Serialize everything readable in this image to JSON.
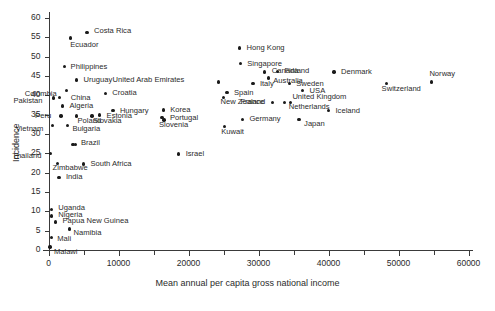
{
  "chart_data": {
    "type": "scatter",
    "title": "",
    "xlabel": "Mean annual per capita gross national income",
    "ylabel": "Incidence",
    "xlim": [
      0,
      60000
    ],
    "ylim": [
      0,
      62
    ],
    "xticks": [
      0,
      10000,
      20000,
      30000,
      40000,
      50000,
      60000
    ],
    "xtick_labels": [
      "0",
      "10000",
      "20000",
      "30000",
      "40000",
      "50000",
      "60000"
    ],
    "xminor_ticks": [
      5000,
      15000,
      25000,
      35000,
      45000,
      55000
    ],
    "yticks": [
      0,
      5,
      10,
      15,
      20,
      25,
      30,
      35,
      40,
      45,
      50,
      55,
      60
    ],
    "ytick_labels": [
      "0",
      "5",
      "10",
      "15",
      "20",
      "25",
      "30",
      "35",
      "40",
      "45",
      "50",
      "55",
      "60"
    ],
    "grid": false,
    "legend": "none",
    "marker": "filled-circle",
    "marker_color": "#1a1a1a",
    "points": [
      {
        "label": "Costa Rica",
        "x": 5500,
        "y": 56.3,
        "lx": 7,
        "ly": -1
      },
      {
        "label": "Ecuador",
        "x": 3100,
        "y": 54.8,
        "lx": 0,
        "ly": 7
      },
      {
        "label": "Philippines",
        "x": 2300,
        "y": 47.4,
        "lx": 6,
        "ly": 0
      },
      {
        "label": "Uruguay",
        "x": 4000,
        "y": 44.0,
        "lx": 7,
        "ly": 0
      },
      {
        "label": "Colombia",
        "x": 2600,
        "y": 41.2,
        "lx": -42,
        "ly": 3
      },
      {
        "label": "Croatia",
        "x": 8100,
        "y": 40.5,
        "lx": 7,
        "ly": 0
      },
      {
        "label": "China",
        "x": 1600,
        "y": 39.5,
        "lx": 11,
        "ly": 1
      },
      {
        "label": "Pakistan",
        "x": 700,
        "y": 39.3,
        "lx": -40,
        "ly": 3
      },
      {
        "label": "Algeria",
        "x": 2000,
        "y": 37.2,
        "lx": 7,
        "ly": 0
      },
      {
        "label": "Hungary",
        "x": 9200,
        "y": 36.0,
        "lx": 7,
        "ly": 0
      },
      {
        "label": "Peru",
        "x": 1800,
        "y": 34.7,
        "lx": -26,
        "ly": 0
      },
      {
        "label": "Poland",
        "x": 4000,
        "y": 34.7,
        "lx": 1,
        "ly": 5
      },
      {
        "label": "Slovakia",
        "x": 6200,
        "y": 34.7,
        "lx": 1,
        "ly": 5
      },
      {
        "label": "Estonia",
        "x": 7300,
        "y": 34.9,
        "lx": 7,
        "ly": 1
      },
      {
        "label": "Vietnam",
        "x": 600,
        "y": 32.2,
        "lx": -37,
        "ly": 4
      },
      {
        "label": "Bulgaria",
        "x": 2700,
        "y": 32.2,
        "lx": 5,
        "ly": 4
      },
      {
        "label": "Brazil",
        "x": 3500,
        "y": 27.3,
        "lx": 8,
        "ly": -1
      },
      {
        "label": "",
        "x": 3900,
        "y": 27.3,
        "lx": 0,
        "ly": 0
      },
      {
        "label": "Thailand",
        "x": 250,
        "y": 25.0,
        "lx": -38,
        "ly": 3
      },
      {
        "label": "Israel",
        "x": 18600,
        "y": 24.8,
        "lx": 7,
        "ly": 0
      },
      {
        "label": "Zimbabwe",
        "x": 1300,
        "y": 22.4,
        "lx": -5,
        "ly": 5
      },
      {
        "label": "South Africa",
        "x": 5000,
        "y": 22.2,
        "lx": 7,
        "ly": 0
      },
      {
        "label": "India",
        "x": 1500,
        "y": 18.8,
        "lx": 7,
        "ly": 0
      },
      {
        "label": "Uganda",
        "x": 400,
        "y": 10.5,
        "lx": 7,
        "ly": -1
      },
      {
        "label": "Nigeria",
        "x": 400,
        "y": 8.8,
        "lx": 7,
        "ly": -1
      },
      {
        "label": "Papua New Guinea",
        "x": 1000,
        "y": 7.2,
        "lx": 7,
        "ly": -1
      },
      {
        "label": "Namibia",
        "x": 3000,
        "y": 5.4,
        "lx": 4,
        "ly": 4
      },
      {
        "label": "Mali",
        "x": 400,
        "y": 3.2,
        "lx": 6,
        "ly": 1
      },
      {
        "label": "Malawi",
        "x": 200,
        "y": 0.8,
        "lx": 4,
        "ly": 5
      },
      {
        "label": "United Arab Emirates",
        "x": 24300,
        "y": 43.4,
        "lx": -106,
        "ly": -2
      },
      {
        "label": "Hong Kong",
        "x": 27300,
        "y": 52.2,
        "lx": 7,
        "ly": 0
      },
      {
        "label": "Singapore",
        "x": 27400,
        "y": 48.2,
        "lx": 7,
        "ly": 0
      },
      {
        "label": "Canada",
        "x": 30900,
        "y": 46.0,
        "lx": 7,
        "ly": -1
      },
      {
        "label": "Finland",
        "x": 32700,
        "y": 46.2,
        "lx": 7,
        "ly": 0
      },
      {
        "label": "Denmark",
        "x": 40800,
        "y": 46.0,
        "lx": 7,
        "ly": 0
      },
      {
        "label": "Australia",
        "x": 31400,
        "y": 44.5,
        "lx": 5,
        "ly": 3
      },
      {
        "label": "Italy",
        "x": 29200,
        "y": 43.0,
        "lx": 7,
        "ly": 0
      },
      {
        "label": "Sweden",
        "x": 34400,
        "y": 43.0,
        "lx": 7,
        "ly": 0
      },
      {
        "label": "Switzerland",
        "x": 48300,
        "y": 43.0,
        "lx": -5,
        "ly": 5
      },
      {
        "label": "Norway",
        "x": 54700,
        "y": 43.4,
        "lx": -2,
        "ly": -8
      },
      {
        "label": "USA",
        "x": 36300,
        "y": 41.2,
        "lx": 7,
        "ly": 0
      },
      {
        "label": "Spain",
        "x": 25500,
        "y": 40.7,
        "lx": 7,
        "ly": 0
      },
      {
        "label": "New Zealand",
        "x": 25000,
        "y": 39.5,
        "lx": -3,
        "ly": 5
      },
      {
        "label": "France",
        "x": 32000,
        "y": 38.2,
        "lx": -32,
        "ly": 0
      },
      {
        "label": "United Kingdom",
        "x": 33700,
        "y": 38.2,
        "lx": 8,
        "ly": -5
      },
      {
        "label": "Netherlands",
        "x": 34600,
        "y": 38.2,
        "lx": -2,
        "ly": 5
      },
      {
        "label": "Iceland",
        "x": 40000,
        "y": 36.0,
        "lx": 7,
        "ly": 0
      },
      {
        "label": "Korea",
        "x": 16400,
        "y": 36.2,
        "lx": 7,
        "ly": 0
      },
      {
        "label": "Portugal",
        "x": 16200,
        "y": 34.2,
        "lx": 8,
        "ly": 0
      },
      {
        "label": "Slovenia",
        "x": 16500,
        "y": 33.6,
        "lx": -5,
        "ly": 5
      },
      {
        "label": "Germany",
        "x": 27700,
        "y": 33.8,
        "lx": 7,
        "ly": 0
      },
      {
        "label": "Japan",
        "x": 35800,
        "y": 33.8,
        "lx": 5,
        "ly": 5
      },
      {
        "label": "Kuwait",
        "x": 25100,
        "y": 31.9,
        "lx": -3,
        "ly": 5
      }
    ]
  }
}
